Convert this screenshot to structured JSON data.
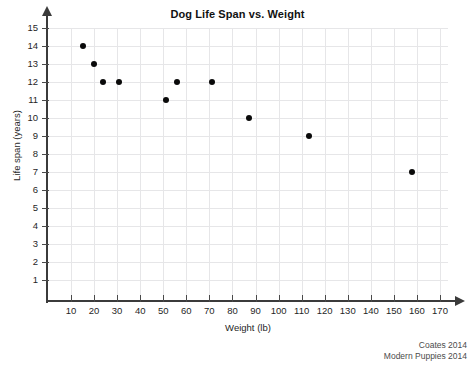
{
  "figure": {
    "top_remnant_text": "· ·   ·· ·  ·",
    "credits": [
      "Coates 2014",
      "Modern Puppies 2014"
    ]
  },
  "chart_data": {
    "type": "scatter",
    "title": "Dog Life Span vs. Weight",
    "xlabel": "Weight (lb)",
    "ylabel": "Life span (years)",
    "xlim": [
      0,
      175
    ],
    "ylim": [
      0,
      15.5
    ],
    "grid": true,
    "legend": null,
    "xticks": [
      10,
      20,
      30,
      40,
      50,
      60,
      70,
      80,
      90,
      100,
      110,
      120,
      130,
      140,
      150,
      160,
      170
    ],
    "yticks": [
      1,
      2,
      3,
      4,
      5,
      6,
      7,
      8,
      9,
      10,
      11,
      12,
      13,
      14,
      15
    ],
    "marker": {
      "shape": "circle",
      "color": "#0a0a0a",
      "size": 6
    },
    "points": [
      {
        "x": 15,
        "y": 14
      },
      {
        "x": 20,
        "y": 13
      },
      {
        "x": 24,
        "y": 12
      },
      {
        "x": 31,
        "y": 12
      },
      {
        "x": 51,
        "y": 11
      },
      {
        "x": 56,
        "y": 12
      },
      {
        "x": 71,
        "y": 12
      },
      {
        "x": 87,
        "y": 10
      },
      {
        "x": 113,
        "y": 9
      },
      {
        "x": 158,
        "y": 7
      }
    ]
  }
}
